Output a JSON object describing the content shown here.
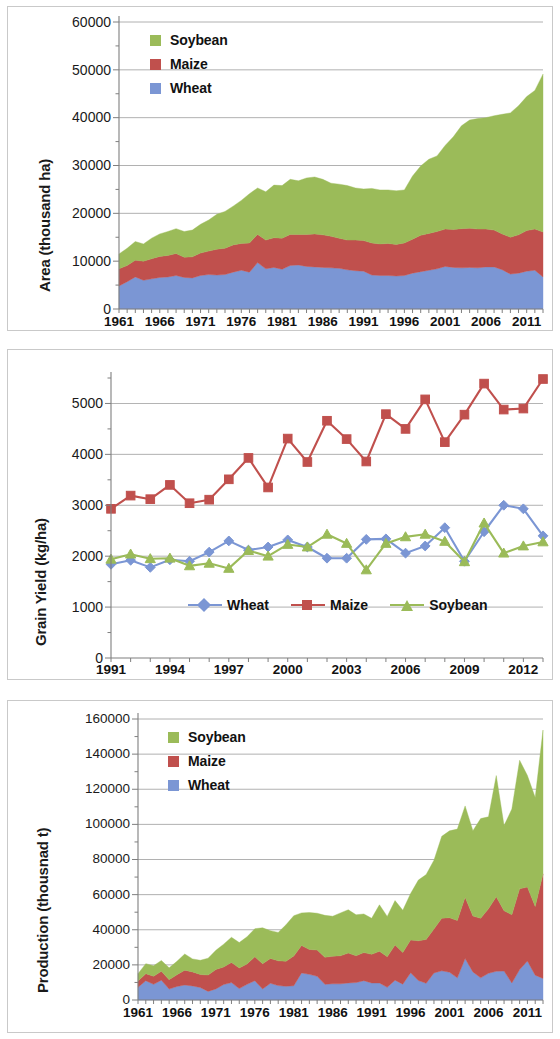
{
  "colors": {
    "wheat": "#7B96D4",
    "maize": "#C0504D",
    "soybean": "#9BBB59",
    "grid": "#9a9a9a",
    "axis": "#7f7f7f",
    "text": "#111111",
    "panel_border": "#c9c9c9"
  },
  "panels": [
    {
      "id": "area",
      "name": "area-chart-panel"
    },
    {
      "id": "yield",
      "name": "grain-yield-chart-panel"
    },
    {
      "id": "production",
      "name": "production-chart-panel"
    }
  ],
  "chart_data": [
    {
      "type": "area",
      "stacked": true,
      "title": "",
      "xlabel": "",
      "ylabel": "Area (thousand ha)",
      "ylim": [
        0,
        60000
      ],
      "ytick_labels": [
        "0",
        "10000",
        "20000",
        "30000",
        "40000",
        "50000",
        "60000"
      ],
      "ytick_values": [
        0,
        10000,
        20000,
        30000,
        40000,
        50000,
        60000
      ],
      "xtick_labels": [
        "1961",
        "1966",
        "1971",
        "1976",
        "1981",
        "1986",
        "1991",
        "1996",
        "2001",
        "2006",
        "2011"
      ],
      "xtick_values": [
        1961,
        1966,
        1971,
        1976,
        1981,
        1986,
        1991,
        1996,
        2001,
        2006,
        2011
      ],
      "xlim": [
        1961,
        2013
      ],
      "grid": true,
      "legend_position": "top-left",
      "legend": [
        "Soybean",
        "Maize",
        "Wheat"
      ],
      "x": [
        1961,
        1962,
        1963,
        1964,
        1965,
        1966,
        1967,
        1968,
        1969,
        1970,
        1971,
        1972,
        1973,
        1974,
        1975,
        1976,
        1977,
        1978,
        1979,
        1980,
        1981,
        1982,
        1983,
        1984,
        1985,
        1986,
        1987,
        1988,
        1989,
        1990,
        1991,
        1992,
        1993,
        1994,
        1995,
        1996,
        1997,
        1998,
        1999,
        2000,
        2001,
        2002,
        2003,
        2004,
        2005,
        2006,
        2007,
        2008,
        2009,
        2010,
        2011,
        2012,
        2013
      ],
      "series": [
        {
          "name": "Wheat",
          "color": "#7B96D4",
          "values": [
            4800,
            5700,
            6700,
            6000,
            6300,
            6600,
            6700,
            7000,
            6600,
            6500,
            7000,
            7200,
            7100,
            7200,
            7700,
            8100,
            7700,
            9700,
            8400,
            8700,
            8300,
            9100,
            9200,
            8900,
            8800,
            8700,
            8600,
            8500,
            8200,
            8000,
            7900,
            7100,
            7000,
            7000,
            6900,
            7000,
            7500,
            7800,
            8100,
            8400,
            8900,
            8700,
            8600,
            8700,
            8600,
            8800,
            8800,
            8200,
            7300,
            7500,
            7900,
            8100,
            6700
          ]
        },
        {
          "name": "Maize",
          "color": "#C0504D",
          "values": [
            3600,
            3400,
            3500,
            4000,
            4200,
            4400,
            4500,
            4600,
            4200,
            4400,
            4700,
            4900,
            5400,
            5500,
            5700,
            5600,
            6100,
            5900,
            6000,
            6200,
            6500,
            6500,
            6400,
            6700,
            6900,
            6800,
            6600,
            6300,
            6200,
            6400,
            6400,
            6700,
            6600,
            6700,
            6600,
            6800,
            7100,
            7600,
            7700,
            7800,
            7800,
            7900,
            8200,
            8200,
            8100,
            7900,
            7700,
            7500,
            7700,
            8000,
            8500,
            8600,
            9400
          ]
        },
        {
          "name": "Soybean",
          "color": "#9BBB59",
          "values": [
            3100,
            3600,
            3900,
            3600,
            4300,
            4700,
            5000,
            5200,
            5400,
            5600,
            6000,
            6500,
            7300,
            7700,
            8100,
            9000,
            10300,
            9700,
            10100,
            11000,
            11000,
            11500,
            11200,
            11800,
            11900,
            11600,
            11100,
            11300,
            11400,
            10900,
            10800,
            11400,
            11300,
            11200,
            11200,
            11100,
            13200,
            14500,
            15500,
            15800,
            17500,
            19400,
            21500,
            22600,
            23100,
            23300,
            23900,
            25000,
            26000,
            27000,
            28000,
            29000,
            33000
          ]
        }
      ]
    },
    {
      "type": "line",
      "title": "",
      "xlabel": "",
      "ylabel": "Grain Yield (kg/ha)",
      "ylim": [
        0,
        5500
      ],
      "ytick_labels": [
        "0",
        "1000",
        "2000",
        "3000",
        "4000",
        "5000"
      ],
      "ytick_values": [
        0,
        1000,
        2000,
        3000,
        4000,
        5000
      ],
      "xtick_labels": [
        "1991",
        "1994",
        "1997",
        "2000",
        "2003",
        "2006",
        "2009",
        "2012"
      ],
      "xtick_values": [
        1991,
        1994,
        1997,
        2000,
        2003,
        2006,
        2009,
        2012
      ],
      "xlim": [
        1991,
        2013
      ],
      "grid": true,
      "legend_position": "bottom-center",
      "legend": [
        "Wheat",
        "Maize",
        "Soybean"
      ],
      "x": [
        1991,
        1992,
        1993,
        1994,
        1995,
        1996,
        1997,
        1998,
        1999,
        2000,
        2001,
        2002,
        2003,
        2004,
        2005,
        2006,
        2007,
        2008,
        2009,
        2010,
        2011,
        2012,
        2013
      ],
      "series": [
        {
          "name": "Wheat",
          "color": "#7B96D4",
          "marker": "diamond",
          "values": [
            1840,
            1920,
            1780,
            1930,
            1900,
            2080,
            2300,
            2120,
            2180,
            2320,
            2180,
            1960,
            1960,
            2330,
            2340,
            2060,
            2200,
            2560,
            1900,
            2480,
            3000,
            2930,
            2400
          ]
        },
        {
          "name": "Maize",
          "color": "#C0504D",
          "marker": "square",
          "values": [
            2930,
            3190,
            3120,
            3400,
            3040,
            3110,
            3510,
            3930,
            3350,
            4310,
            3850,
            4660,
            4300,
            3860,
            4790,
            4500,
            5080,
            4240,
            4780,
            5390,
            4880,
            4900,
            5480
          ]
        },
        {
          "name": "Soybean",
          "color": "#9BBB59",
          "marker": "triangle",
          "values": [
            1940,
            2040,
            1950,
            1960,
            1810,
            1860,
            1760,
            2110,
            2000,
            2230,
            2180,
            2430,
            2250,
            1730,
            2250,
            2380,
            2430,
            2290,
            1890,
            2650,
            2060,
            2200,
            2280
          ]
        }
      ]
    },
    {
      "type": "area",
      "stacked": true,
      "title": "",
      "xlabel": "",
      "ylabel": "Production (thousnad t)",
      "ylim": [
        0,
        160000
      ],
      "ytick_labels": [
        "0",
        "20000",
        "40000",
        "60000",
        "80000",
        "100000",
        "120000",
        "140000",
        "160000"
      ],
      "ytick_values": [
        0,
        20000,
        40000,
        60000,
        80000,
        100000,
        120000,
        140000,
        160000
      ],
      "xtick_labels": [
        "1961",
        "1966",
        "1971",
        "1976",
        "1981",
        "1986",
        "1991",
        "1996",
        "2001",
        "2006",
        "2011"
      ],
      "xtick_values": [
        1961,
        1966,
        1971,
        1976,
        1981,
        1986,
        1991,
        1996,
        2001,
        2006,
        2011
      ],
      "xlim": [
        1961,
        2013
      ],
      "grid": true,
      "legend_position": "top-left",
      "legend": [
        "Soybean",
        "Maize",
        "Wheat"
      ],
      "x": [
        1961,
        1962,
        1963,
        1964,
        1965,
        1966,
        1967,
        1968,
        1969,
        1970,
        1971,
        1972,
        1973,
        1974,
        1975,
        1976,
        1977,
        1978,
        1979,
        1980,
        1981,
        1982,
        1983,
        1984,
        1985,
        1986,
        1987,
        1988,
        1989,
        1990,
        1991,
        1992,
        1993,
        1994,
        1995,
        1996,
        1997,
        1998,
        1999,
        2000,
        2001,
        2002,
        2003,
        2004,
        2005,
        2006,
        2007,
        2008,
        2009,
        2010,
        2011,
        2012,
        2013
      ],
      "series": [
        {
          "name": "Wheat",
          "color": "#7B96D4",
          "values": [
            7200,
            11000,
            8900,
            11300,
            6200,
            7700,
            8500,
            8000,
            7100,
            4900,
            6300,
            8800,
            9900,
            6500,
            8900,
            11000,
            6300,
            9500,
            8200,
            7800,
            8100,
            15400,
            14600,
            13500,
            8900,
            9200,
            9200,
            9700,
            9900,
            11000,
            9700,
            9700,
            7200,
            11300,
            9000,
            15500,
            11100,
            9500,
            15400,
            16600,
            15800,
            12600,
            23600,
            16000,
            12600,
            15200,
            16300,
            16500,
            9700,
            17300,
            22200,
            14100,
            12300
          ]
        },
        {
          "name": "Maize",
          "color": "#C0504D",
          "values": [
            3600,
            4000,
            4600,
            5000,
            5400,
            6700,
            8500,
            8000,
            7400,
            9300,
            11000,
            10000,
            11500,
            11700,
            11600,
            13600,
            14300,
            14100,
            14100,
            14200,
            16900,
            15700,
            14200,
            14900,
            15400,
            15700,
            16000,
            17000,
            15300,
            16000,
            16300,
            18000,
            17400,
            20000,
            18000,
            18700,
            22600,
            25000,
            25000,
            30000,
            31000,
            32700,
            34900,
            31800,
            33900,
            36800,
            42500,
            34300,
            38900,
            46000,
            42100,
            39200,
            59500
          ]
        },
        {
          "name": "Soybean",
          "color": "#9BBB59",
          "values": [
            4200,
            5700,
            6000,
            6200,
            6700,
            7600,
            9200,
            7400,
            8100,
            9600,
            11000,
            13000,
            14300,
            14500,
            15500,
            16000,
            20500,
            15900,
            16200,
            20800,
            23000,
            18500,
            21000,
            21000,
            23900,
            22800,
            24400,
            24700,
            23300,
            22000,
            20500,
            26500,
            23000,
            25300,
            24100,
            26400,
            34600,
            36900,
            39200,
            46600,
            49500,
            52000,
            52000,
            48600,
            56800,
            52300,
            69000,
            48500,
            60100,
            73200,
            63500,
            62000,
            81900
          ]
        }
      ]
    }
  ]
}
